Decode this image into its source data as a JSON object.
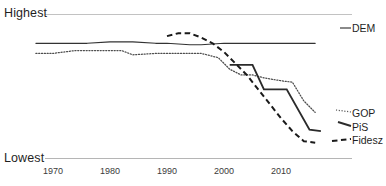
{
  "chart_data": {
    "type": "line",
    "title": "",
    "subtitle": "",
    "xlabel": "",
    "ylabel": "",
    "grid": false,
    "legend_position": "right-inline",
    "y_axis": {
      "top_label": "Highest",
      "bottom_label": "Lowest",
      "ticks": [
        "Highest",
        "Lowest"
      ],
      "note": "Ordinal scale, unlabeled units (qualitative ranking axis)"
    },
    "x_axis": {
      "ticks": [
        1970,
        1980,
        1990,
        2000,
        2010
      ],
      "xlim": [
        1966,
        2018
      ]
    },
    "series": [
      {
        "name": "DEM",
        "style": "solid-thin",
        "color": "#333333",
        "x": [
          1967,
          1972,
          1976,
          1980,
          1984,
          1988,
          1990,
          1994,
          1996,
          2000,
          2004,
          2008,
          2012,
          2016
        ],
        "y": [
          0.8,
          0.8,
          0.8,
          0.81,
          0.81,
          0.8,
          0.8,
          0.79,
          0.79,
          0.8,
          0.8,
          0.8,
          0.8,
          0.8
        ]
      },
      {
        "name": "GOP",
        "style": "dotted",
        "color": "#4d4d4d",
        "x": [
          1967,
          1970,
          1974,
          1978,
          1982,
          1984,
          1988,
          1992,
          1996,
          1999,
          2001,
          2003,
          2005,
          2007,
          2010,
          2012,
          2014,
          2016
        ],
        "y": [
          0.73,
          0.73,
          0.75,
          0.75,
          0.75,
          0.72,
          0.73,
          0.73,
          0.73,
          0.7,
          0.62,
          0.58,
          0.58,
          0.56,
          0.54,
          0.53,
          0.4,
          0.32
        ]
      },
      {
        "name": "PiS",
        "style": "solid-thick",
        "color": "#2b2b2b",
        "x": [
          2001,
          2005,
          2005,
          2007,
          2007,
          2011,
          2011,
          2015,
          2017
        ],
        "y": [
          0.65,
          0.65,
          0.65,
          0.48,
          0.48,
          0.48,
          0.48,
          0.2,
          0.19
        ]
      },
      {
        "name": "Fidesz",
        "style": "dashed",
        "color": "#1a1a1a",
        "x": [
          1990,
          1992,
          1994,
          1996,
          1998,
          2000,
          2002,
          2004,
          2006,
          2008,
          2010,
          2012,
          2014,
          2016
        ],
        "y": [
          0.85,
          0.87,
          0.87,
          0.84,
          0.8,
          0.74,
          0.66,
          0.58,
          0.48,
          0.38,
          0.28,
          0.19,
          0.12,
          0.11
        ]
      }
    ],
    "annotations": []
  },
  "labels": {
    "highest": "Highest",
    "lowest": "Lowest"
  },
  "series_labels": {
    "dem": "DEM",
    "gop": "GOP",
    "pis": "PiS",
    "fidesz": "Fidesz"
  },
  "x_tick_labels": [
    "1970",
    "1980",
    "1990",
    "2000",
    "2010"
  ],
  "colors": {
    "background": "#ffffff",
    "gridline": "#bdbdbd",
    "text": "#1f1f1f",
    "dem": "#333333",
    "gop": "#4d4d4d",
    "pis": "#2b2b2b",
    "fidesz": "#1a1a1a"
  }
}
